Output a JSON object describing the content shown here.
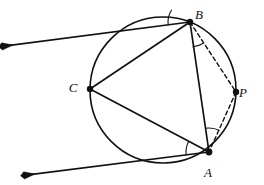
{
  "figure": {
    "type": "circle-geometry-diagram",
    "canvas": {
      "width": 264,
      "height": 185,
      "background": "#ffffff"
    }
  },
  "colors": {
    "stroke": "#111111",
    "background": "#ffffff",
    "arc_mark": "#111111"
  },
  "circle": {
    "name": "main-circle",
    "center_x": 163,
    "center_y": 90,
    "radius": 73,
    "stroke_width": 1.6,
    "style": "solid"
  },
  "points": [
    {
      "id": "B",
      "label": "B",
      "x": 190,
      "y": 22,
      "label_x": 199,
      "label_y": 19,
      "dot_radius": 3.2,
      "on_circle": true
    },
    {
      "id": "C",
      "label": "C",
      "x": 90,
      "y": 89,
      "label_x": 73,
      "label_y": 92,
      "dot_radius": 3.2,
      "on_circle": true
    },
    {
      "id": "P",
      "label": "P",
      "x": 236,
      "y": 92,
      "label_x": 243,
      "label_y": 97,
      "dot_radius": 3.2,
      "on_circle": true
    },
    {
      "id": "A",
      "label": "A",
      "x": 209,
      "y": 152,
      "label_x": 208,
      "label_y": 177,
      "dot_radius": 3.4,
      "on_circle": true
    }
  ],
  "segments": [
    {
      "id": "BC",
      "name": "chord-b-c",
      "from": "B",
      "to": "C",
      "x1": 190,
      "y1": 22,
      "x2": 90,
      "y2": 89,
      "style": "solid",
      "stroke_width": 1.7
    },
    {
      "id": "CA",
      "name": "chord-c-a",
      "from": "C",
      "to": "A",
      "x1": 90,
      "y1": 89,
      "x2": 209,
      "y2": 152,
      "style": "solid",
      "stroke_width": 1.7
    },
    {
      "id": "BA",
      "name": "chord-b-a",
      "from": "B",
      "to": "A",
      "x1": 190,
      "y1": 22,
      "x2": 209,
      "y2": 152,
      "style": "solid",
      "stroke_width": 1.7
    },
    {
      "id": "BP",
      "name": "chord-b-p-dashed",
      "from": "B",
      "to": "P",
      "x1": 190,
      "y1": 22,
      "x2": 236,
      "y2": 92,
      "style": "dashed",
      "stroke_width": 1.4,
      "dash": "4,3"
    },
    {
      "id": "PA",
      "name": "chord-p-a-dashed",
      "from": "P",
      "to": "A",
      "x1": 236,
      "y1": 92,
      "x2": 209,
      "y2": 152,
      "style": "dashed",
      "stroke_width": 1.4,
      "dash": "4,3"
    }
  ],
  "rays": [
    {
      "id": "tangent-at-B",
      "name": "tangent-ray-b",
      "from_point": "B",
      "x1": 190,
      "y1": 22,
      "x2": 13,
      "y2": 45,
      "style": "solid",
      "stroke_width": 1.7,
      "arrowhead": "end",
      "description": "tangent ray at B directed to the upper left"
    },
    {
      "id": "tangent-at-A",
      "name": "tangent-ray-a",
      "from_point": "A",
      "x1": 209,
      "y1": 152,
      "x2": 35,
      "y2": 174,
      "style": "solid",
      "stroke_width": 1.7,
      "arrowhead": "end",
      "description": "tangent ray at A directed to the lower left"
    }
  ],
  "angle_marks": [
    {
      "id": "angle-B-tangent-chord",
      "name": "angle-arc-b-tangent-chord",
      "vertex": "B",
      "cx": 190,
      "cy": 22,
      "radius": 22,
      "start_deg": 172,
      "end_deg": 214,
      "description": "angle between tangent at B and chord BC"
    },
    {
      "id": "angle-B-inscribed",
      "name": "angle-arc-b-inscribed",
      "vertex": "B",
      "cx": 190,
      "cy": 22,
      "radius": 25,
      "start_deg": 57,
      "end_deg": 84,
      "description": "angle PBA between chord BA and dashed BP"
    },
    {
      "id": "angle-A-tangent-chord",
      "name": "angle-arc-a-tangent-chord",
      "vertex": "A",
      "cx": 209,
      "cy": 152,
      "radius": 23,
      "start_deg": 172,
      "end_deg": 208,
      "description": "angle between tangent at A and chord AC"
    },
    {
      "id": "angle-A-inscribed",
      "name": "angle-arc-a-inscribed",
      "vertex": "A",
      "cx": 209,
      "cy": 152,
      "radius": 24,
      "start_deg": 261,
      "end_deg": 296,
      "description": "angle PAB between chord AB and dashed AP"
    }
  ],
  "arrowhead": {
    "name": "arrowhead-marker",
    "length": 11,
    "half_width": 3.6
  }
}
